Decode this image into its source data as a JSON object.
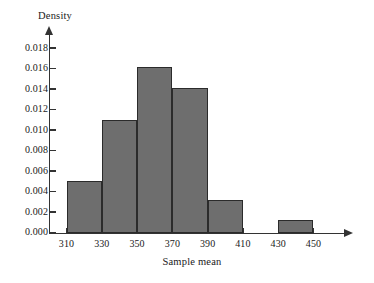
{
  "chart_data": {
    "type": "bar",
    "title": "",
    "subtitle": "",
    "xlabel": "Sample mean",
    "ylabel": "Density",
    "xlim": [
      300,
      460
    ],
    "ylim": [
      0.0,
      0.019
    ],
    "grid": false,
    "legend": null,
    "bar_color": "#6e6e6e",
    "bar_edge_color": "#2b2b2b",
    "axis_color": "#333333",
    "bin_width": 20,
    "x_ticks": [
      310,
      330,
      350,
      370,
      390,
      410,
      430,
      450
    ],
    "x_tick_labels": [
      "310",
      "330",
      "350",
      "370",
      "390",
      "410",
      "430",
      "450"
    ],
    "y_ticks": [
      0.0,
      0.002,
      0.004,
      0.006,
      0.008,
      0.01,
      0.012,
      0.014,
      0.016,
      0.018
    ],
    "y_tick_labels": [
      "0.000",
      "0.002",
      "0.004",
      "0.006",
      "0.008",
      "0.010",
      "0.012",
      "0.014",
      "0.016",
      "0.018"
    ],
    "bins": [
      {
        "left": 310,
        "right": 330,
        "density": 0.005
      },
      {
        "left": 330,
        "right": 350,
        "density": 0.011
      },
      {
        "left": 350,
        "right": 370,
        "density": 0.0161
      },
      {
        "left": 370,
        "right": 390,
        "density": 0.0141
      },
      {
        "left": 390,
        "right": 410,
        "density": 0.0032
      },
      {
        "left": 430,
        "right": 450,
        "density": 0.0012
      }
    ],
    "categories": [
      "310-330",
      "330-350",
      "350-370",
      "370-390",
      "390-410",
      "430-450"
    ],
    "values": [
      0.005,
      0.011,
      0.0161,
      0.0141,
      0.0032,
      0.0012
    ]
  }
}
